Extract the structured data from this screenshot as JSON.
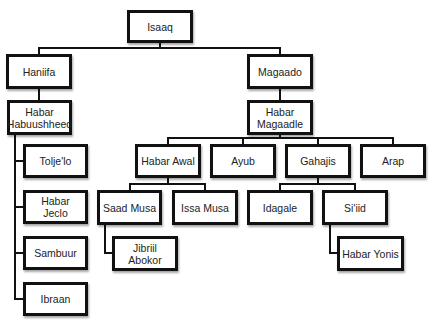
{
  "diagram": {
    "type": "family-tree",
    "nodes": {
      "isaaq": "Isaaq",
      "haniifa": "Haniifa",
      "magaado": "Magaado",
      "habar_habuushheed": "Habar Habuushheed",
      "habar_magaadle": "Habar Magaadle",
      "tolje_lo": "Tolje'lo",
      "habar_jeclo": "Habar Jeclo",
      "sambuur": "Sambuur",
      "ibraan": "Ibraan",
      "habar_awal": "Habar Awal",
      "ayub": "Ayub",
      "gahajis": "Gahajis",
      "arap": "Arap",
      "saad_musa": "Saad Musa",
      "issa_musa": "Issa Musa",
      "idagale": "Idagale",
      "si_iid": "Si'iid",
      "jibriil_abokor": "Jibriil Abokor",
      "habar_yonis": "Habar Yonis"
    },
    "edges": [
      [
        "Isaaq",
        "Haniifa"
      ],
      [
        "Isaaq",
        "Magaado"
      ],
      [
        "Haniifa",
        "Habar Habuushheed"
      ],
      [
        "Habar Habuushheed",
        "Tolje'lo"
      ],
      [
        "Habar Habuushheed",
        "Habar Jeclo"
      ],
      [
        "Habar Habuushheed",
        "Sambuur"
      ],
      [
        "Habar Habuushheed",
        "Ibraan"
      ],
      [
        "Magaado",
        "Habar Magaadle"
      ],
      [
        "Habar Magaadle",
        "Habar Awal"
      ],
      [
        "Habar Magaadle",
        "Ayub"
      ],
      [
        "Habar Magaadle",
        "Gahajis"
      ],
      [
        "Habar Magaadle",
        "Arap"
      ],
      [
        "Habar Awal",
        "Saad Musa"
      ],
      [
        "Habar Awal",
        "Issa Musa"
      ],
      [
        "Saad Musa",
        "Jibriil Abokor"
      ],
      [
        "Gahajis",
        "Idagale"
      ],
      [
        "Gahajis",
        "Si'iid"
      ],
      [
        "Si'iid",
        "Habar Yonis"
      ]
    ]
  }
}
